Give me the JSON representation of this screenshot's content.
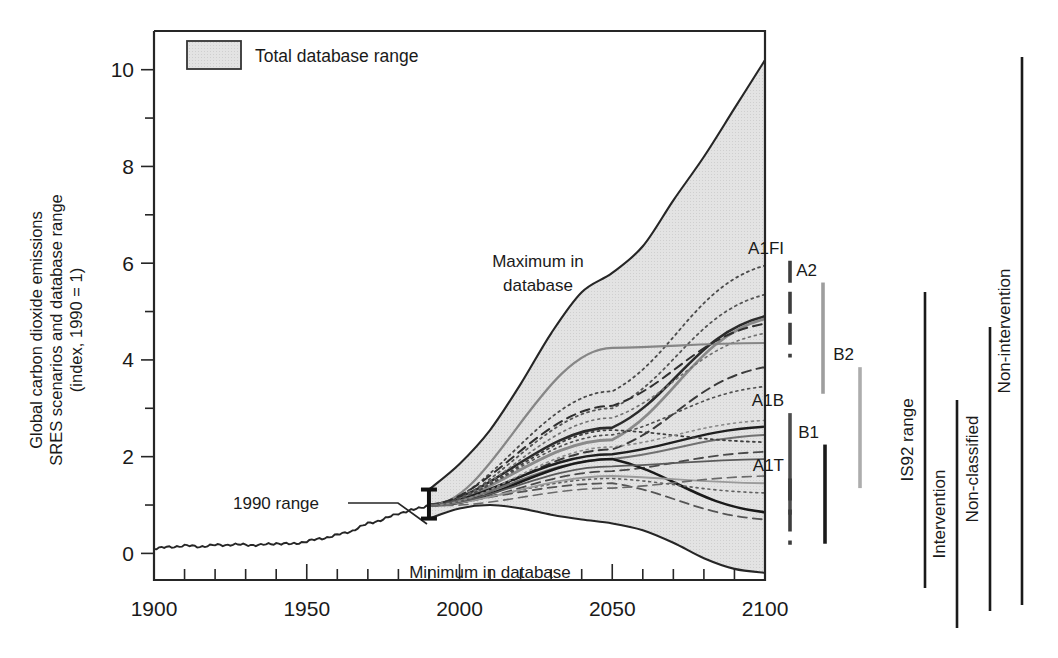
{
  "chart_data": {
    "type": "area",
    "title": "",
    "xlabel": "",
    "ylabel": "Global carbon dioxide emissions SRES scenarios and database range (index, 1990 = 1)",
    "ylabel_lines": [
      "Global carbon dioxide emissions",
      "SRES scenarios and database range",
      "(index, 1990 = 1)"
    ],
    "xlim": [
      1900,
      2100
    ],
    "ylim": [
      -0.55,
      10.8
    ],
    "grid": false,
    "legend_position": "top-left-inside",
    "x_ticks": [
      1900,
      1950,
      2000,
      2050,
      2100
    ],
    "x_tick_labels": [
      "1900",
      "1950",
      "2000",
      "2050",
      "2100"
    ],
    "x_minor_tick_step": 10,
    "y_ticks": [
      0,
      2,
      4,
      6,
      8,
      10
    ],
    "y_tick_labels": [
      "0",
      "2",
      "4",
      "6",
      "8",
      "10"
    ],
    "y_minor_ticks": [
      1,
      3,
      5,
      7,
      9
    ],
    "legend": [
      {
        "label": "Total database range",
        "swatch": "#d9d9d9",
        "swatch_border": "#333333"
      }
    ],
    "annotations": [
      {
        "name": "maximum-in-database",
        "text_lines": [
          "Maximum in",
          "database"
        ],
        "x": 2020,
        "y": 6.0
      },
      {
        "name": "minimum-in-database",
        "text_lines": [
          "Minimum in database"
        ],
        "x": 2017,
        "y": 0.25
      },
      {
        "name": "1990-range",
        "text_lines": [
          "1990 range"
        ],
        "x": 1955,
        "y": 1.75
      }
    ],
    "error_bar": {
      "name": "1990-range-bar",
      "x": 1990,
      "low": 0.72,
      "high": 1.32
    },
    "series": [
      {
        "name": "Historical emissions",
        "style": "solid",
        "color": "#262626",
        "x": [
          1900,
          1905,
          1910,
          1915,
          1920,
          1925,
          1930,
          1935,
          1940,
          1945,
          1950,
          1955,
          1960,
          1965,
          1970,
          1975,
          1980,
          1985,
          1990
        ],
        "values": [
          0.1,
          0.13,
          0.16,
          0.14,
          0.17,
          0.18,
          0.18,
          0.17,
          0.21,
          0.19,
          0.25,
          0.31,
          0.38,
          0.47,
          0.62,
          0.7,
          0.83,
          0.9,
          1.0
        ]
      },
      {
        "name": "Maximum in database envelope",
        "style": "solid",
        "color": "#262626",
        "x": [
          1990,
          2000,
          2010,
          2020,
          2030,
          2040,
          2050,
          2060,
          2070,
          2080,
          2090,
          2100
        ],
        "values": [
          1.32,
          1.85,
          2.55,
          3.5,
          4.55,
          5.4,
          5.8,
          6.35,
          7.3,
          8.2,
          9.2,
          10.2
        ]
      },
      {
        "name": "Minimum in database envelope",
        "style": "solid",
        "color": "#262626",
        "x": [
          1990,
          2000,
          2010,
          2020,
          2030,
          2040,
          2050,
          2060,
          2070,
          2080,
          2090,
          2100
        ],
        "values": [
          0.72,
          0.93,
          1.0,
          0.93,
          0.8,
          0.7,
          0.62,
          0.48,
          0.22,
          -0.1,
          -0.32,
          -0.4
        ]
      }
    ],
    "scenario_markers": [
      {
        "name": "A1FI",
        "label": "A1FI",
        "style": "dashed",
        "color": "#3d3d3d",
        "low": 4.05,
        "high": 6.05,
        "x_px": 790
      },
      {
        "name": "A2",
        "label": "A2",
        "style": "solid",
        "color": "#9e9e9e",
        "low": 3.3,
        "high": 5.6,
        "x_px": 823
      },
      {
        "name": "B2",
        "label": "B2",
        "style": "solid",
        "color": "#adadad",
        "low": 1.35,
        "high": 3.85,
        "x_px": 860
      },
      {
        "name": "A1B",
        "label": "A1B",
        "style": "solid",
        "color": "#4d4d4d",
        "low": 0.8,
        "high": 2.9,
        "x_px": 790
      },
      {
        "name": "B1",
        "label": "B1",
        "style": "solid",
        "color": "#1a1a1a",
        "low": 0.2,
        "high": 2.25,
        "x_px": 825
      },
      {
        "name": "A1T",
        "label": "A1T",
        "style": "dashed",
        "color": "#3d3d3d",
        "low": 0.18,
        "high": 1.55,
        "x_px": 790
      }
    ],
    "range_bars": [
      {
        "name": "IS92 range",
        "label": "IS92 range",
        "x_px": 925,
        "top_px": 292,
        "bottom_px": 588
      },
      {
        "name": "Intervention",
        "label": "Intervention",
        "x_px": 957,
        "top_px": 400,
        "bottom_px": 628
      },
      {
        "name": "Non-classified",
        "label": "Non-classified",
        "x_px": 990,
        "top_px": 327,
        "bottom_px": 611
      },
      {
        "name": "Non-intervention",
        "label": "Non-intervention",
        "x_px": 1022,
        "top_px": 57,
        "bottom_px": 605
      }
    ],
    "projection_scenarios_note": "Individual SRES and database scenario trajectories 1990-2100, drawn in solid, dashed and dotted line styles with varying gray tones.",
    "projection_lines": [
      {
        "style": "solid",
        "color": "#2b2b2b",
        "width": 2.6,
        "end": 4.9,
        "mid": 2.6
      },
      {
        "style": "solid",
        "color": "#8a8a8a",
        "width": 2.8,
        "end": 4.85,
        "mid": 2.35
      },
      {
        "style": "dotted",
        "color": "#4a4a4a",
        "width": 1.8,
        "end": 5.95,
        "mid": 3.35
      },
      {
        "style": "dotted",
        "color": "#555555",
        "width": 1.8,
        "end": 5.35,
        "mid": 3.0
      },
      {
        "style": "dashed",
        "color": "#3a3a3a",
        "width": 2.0,
        "end": 3.85,
        "mid": 2.15
      },
      {
        "style": "solid",
        "color": "#1f1f1f",
        "width": 2.4,
        "end": 2.62,
        "mid": 2.05
      },
      {
        "style": "solid",
        "color": "#707070",
        "width": 2.0,
        "end": 2.45,
        "mid": 1.95
      },
      {
        "style": "dotted",
        "color": "#3f3f3f",
        "width": 1.8,
        "end": 2.3,
        "mid": 2.55
      },
      {
        "style": "dashed",
        "color": "#4a4a4a",
        "width": 1.8,
        "end": 2.1,
        "mid": 1.7
      },
      {
        "style": "solid",
        "color": "#1a1a1a",
        "width": 2.6,
        "end": 0.85,
        "mid": 1.95
      },
      {
        "style": "dashed",
        "color": "#555555",
        "width": 1.8,
        "end": 0.7,
        "mid": 1.45
      },
      {
        "style": "dotted",
        "color": "#606060",
        "width": 1.6,
        "end": 1.25,
        "mid": 1.55
      },
      {
        "style": "solid",
        "color": "#9a9a9a",
        "width": 1.8,
        "end": 1.45,
        "mid": 1.6
      },
      {
        "style": "dotted",
        "color": "#707070",
        "width": 1.6,
        "end": 4.55,
        "mid": 2.8
      },
      {
        "style": "solid",
        "color": "#868686",
        "width": 2.2,
        "end": 4.35,
        "mid": 4.25
      },
      {
        "style": "dashed",
        "color": "#2f2f2f",
        "width": 2.0,
        "end": 4.75,
        "mid": 3.05
      },
      {
        "style": "dotted",
        "color": "#4f4f4f",
        "width": 1.6,
        "end": 3.45,
        "mid": 2.45
      },
      {
        "style": "solid",
        "color": "#5a5a5a",
        "width": 1.8,
        "end": 1.95,
        "mid": 1.8
      },
      {
        "style": "dotted",
        "color": "#8a8a8a",
        "width": 1.6,
        "end": 2.75,
        "mid": 2.2
      },
      {
        "style": "dashed",
        "color": "#6a6a6a",
        "width": 1.6,
        "end": 1.6,
        "mid": 1.35
      }
    ]
  }
}
